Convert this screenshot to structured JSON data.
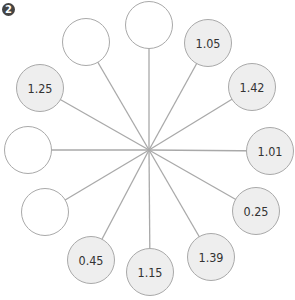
{
  "badge": {
    "label": "2"
  },
  "hub": {
    "x": 149,
    "y": 150
  },
  "colors": {
    "line": "#a9a9a9",
    "filled": "#eeeeee",
    "empty": "#ffffff",
    "text": "#333333"
  },
  "nodes": [
    {
      "id": "top",
      "value": "",
      "x": 149,
      "y": 25
    },
    {
      "id": "n1",
      "value": "1.05",
      "x": 208,
      "y": 43
    },
    {
      "id": "n2",
      "value": "1.42",
      "x": 252,
      "y": 87
    },
    {
      "id": "n3",
      "value": "1.01",
      "x": 270,
      "y": 151
    },
    {
      "id": "n4",
      "value": "0.25",
      "x": 256,
      "y": 211
    },
    {
      "id": "n5",
      "value": "1.39",
      "x": 211,
      "y": 257
    },
    {
      "id": "n6",
      "value": "1.15",
      "x": 150,
      "y": 272
    },
    {
      "id": "n7",
      "value": "0.45",
      "x": 91,
      "y": 260
    },
    {
      "id": "n8",
      "value": "",
      "x": 45,
      "y": 212
    },
    {
      "id": "n9",
      "value": "",
      "x": 28,
      "y": 150
    },
    {
      "id": "n10",
      "value": "1.25",
      "x": 40,
      "y": 88
    },
    {
      "id": "n11",
      "value": "",
      "x": 86,
      "y": 42
    }
  ]
}
